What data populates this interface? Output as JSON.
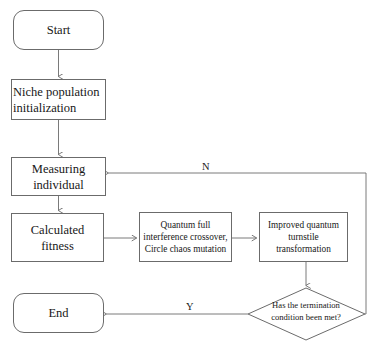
{
  "diagram": {
    "type": "flowchart",
    "background_color": "#ffffff",
    "line_color": "#6b6b6b",
    "text_color": "#171717"
  },
  "nodes": {
    "start": {
      "label": "Start",
      "shape": "terminator"
    },
    "init": {
      "label": "Niche population initialization",
      "shape": "process"
    },
    "measure": {
      "label": "Measuring individual",
      "shape": "process"
    },
    "fitness": {
      "label": "Calculated fitness",
      "shape": "process"
    },
    "crossover": {
      "label": "Quantum full interference crossover, Circle chaos mutation",
      "shape": "process"
    },
    "turnstile": {
      "label": "Improved quantum turnstile transformation",
      "shape": "process"
    },
    "decision": {
      "label": "Has the termination condition been met?",
      "shape": "diamond"
    },
    "end": {
      "label": "End",
      "shape": "terminator"
    }
  },
  "node_lines": {
    "init": [
      "Niche population",
      "initialization"
    ],
    "measure": [
      "Measuring",
      "individual"
    ],
    "fitness": [
      "Calculated",
      "fitness"
    ],
    "crossover": [
      "Quantum full",
      "interference crossover,",
      "Circle chaos mutation"
    ],
    "turnstile": [
      "Improved quantum",
      "turnstile",
      "transformation"
    ],
    "decision": [
      "Has the termination",
      "condition been met?"
    ]
  },
  "edge_labels": {
    "no": "N",
    "yes": "Y"
  },
  "edges": [
    {
      "from": "start",
      "to": "init",
      "label": ""
    },
    {
      "from": "init",
      "to": "measure",
      "label": ""
    },
    {
      "from": "measure",
      "to": "fitness",
      "label": ""
    },
    {
      "from": "fitness",
      "to": "crossover",
      "label": ""
    },
    {
      "from": "crossover",
      "to": "turnstile",
      "label": ""
    },
    {
      "from": "turnstile",
      "to": "decision",
      "label": ""
    },
    {
      "from": "decision",
      "to": "end",
      "label": "Y"
    },
    {
      "from": "decision",
      "to": "measure",
      "label": "N"
    }
  ]
}
